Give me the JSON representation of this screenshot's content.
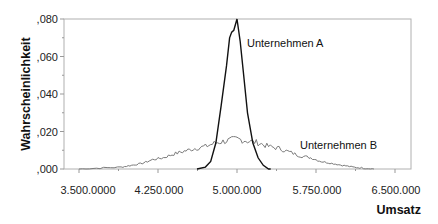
{
  "chart_data": {
    "type": "line",
    "title": "",
    "xlabel": "Umsatz",
    "ylabel": "Wahrscheinlichkeit",
    "xlim": [
      3400000,
      6600000
    ],
    "ylim": [
      0,
      0.08
    ],
    "grid": false,
    "legend_position": "inline labels",
    "x_ticks": [
      3500000,
      4250000,
      5000000,
      5750000,
      6500000
    ],
    "x_tick_labels": [
      "3.500.0000",
      "4.250.000",
      "5.000.000",
      "5.750.000",
      "6.500.000"
    ],
    "y_ticks": [
      0,
      0.02,
      0.04,
      0.06,
      0.08
    ],
    "y_tick_labels": [
      ",000",
      ",020",
      ",040",
      ",060",
      ",080"
    ],
    "series": [
      {
        "name": "Unternehmen A",
        "color": "#111111",
        "x": [
          4620000,
          4700000,
          4750000,
          4800000,
          4850000,
          4900000,
          4930000,
          4950000,
          4970000,
          5000000,
          5030000,
          5060000,
          5100000,
          5150000,
          5200000,
          5250000,
          5300000,
          5320000
        ],
        "y": [
          0.0,
          0.001,
          0.004,
          0.014,
          0.034,
          0.055,
          0.07,
          0.073,
          0.074,
          0.08,
          0.068,
          0.052,
          0.03,
          0.014,
          0.006,
          0.002,
          0.0,
          0.0
        ]
      },
      {
        "name": "Unternehmen B",
        "color": "#777777",
        "x": [
          3500000,
          3700000,
          3900000,
          4000000,
          4100000,
          4200000,
          4300000,
          4400000,
          4500000,
          4600000,
          4700000,
          4800000,
          4900000,
          5000000,
          5100000,
          5200000,
          5300000,
          5400000,
          5500000,
          5600000,
          5700000,
          5800000,
          5900000,
          6000000,
          6100000,
          6200000,
          6300000
        ],
        "y": [
          0.0,
          0.0005,
          0.001,
          0.002,
          0.003,
          0.005,
          0.006,
          0.008,
          0.0095,
          0.011,
          0.012,
          0.014,
          0.015,
          0.016,
          0.015,
          0.014,
          0.012,
          0.011,
          0.009,
          0.007,
          0.006,
          0.004,
          0.003,
          0.002,
          0.001,
          0.0005,
          0.0
        ]
      }
    ],
    "annotations": [
      {
        "text": "Unternehmen A",
        "x": 5060000,
        "y": 0.068
      },
      {
        "text": "Unternehmen B",
        "x": 5540000,
        "y": 0.013
      }
    ]
  },
  "labels": {
    "ylabel": "Wahrscheinlichkeit",
    "xlabel": "Umsatz",
    "series_a": "Unternehmen A",
    "series_b": "Unternehmen B",
    "y_ticks": [
      ",000",
      ",020",
      ",040",
      ",060",
      ",080"
    ],
    "x_ticks": [
      "3.500.0000",
      "4.250.000",
      "5.000.000",
      "5.750.000",
      "6.500.000"
    ]
  }
}
